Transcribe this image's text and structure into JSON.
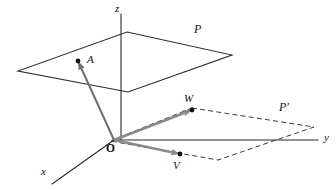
{
  "figure": {
    "background_color": "#ffffff",
    "line_color": "#2b2b2b",
    "vector_color": "#8a8a8a",
    "dot_color": "#111111"
  },
  "axes": [
    {
      "id": "z",
      "label": "z",
      "label_x": 115,
      "label_y": 3,
      "from": [
        121,
        140
      ],
      "to": [
        121,
        14
      ]
    },
    {
      "id": "y",
      "label": "y",
      "label_x": 324,
      "label_y": 132,
      "from": [
        114,
        140
      ],
      "to": [
        318,
        140
      ]
    },
    {
      "id": "x",
      "label": "x",
      "label_x": 41,
      "label_y": 166,
      "from": [
        114,
        140
      ],
      "to": [
        52,
        184
      ]
    }
  ],
  "origin": {
    "label": "O",
    "x": 114,
    "y": 140,
    "label_x": 106,
    "label_y": 143
  },
  "planes": [
    {
      "id": "P",
      "label": "P",
      "style": "solid",
      "label_x": 194,
      "label_y": 23,
      "corners": [
        [
          127,
          32
        ],
        [
          232,
          55
        ],
        [
          128,
          92
        ],
        [
          18,
          71
        ]
      ]
    },
    {
      "id": "P-prime",
      "label": "P'",
      "style": "dashed",
      "label_x": 279,
      "label_y": 101,
      "corners": [
        [
          192,
          108
        ],
        [
          314,
          127
        ],
        [
          218,
          160
        ],
        [
          110,
          141
        ]
      ]
    }
  ],
  "points": [
    {
      "id": "A",
      "label": "A",
      "x": 78,
      "y": 61,
      "label_x": 87,
      "label_y": 54,
      "dot_r": 2.4
    },
    {
      "id": "W",
      "label": "W",
      "x": 192,
      "y": 110,
      "label_x": 184,
      "label_y": 93,
      "dot_r": 2.4
    },
    {
      "id": "V",
      "label": "V",
      "x": 180,
      "y": 154,
      "label_x": 173,
      "label_y": 160,
      "dot_r": 2.4
    }
  ],
  "vectors": [
    {
      "id": "OA",
      "from": [
        114,
        140
      ],
      "to": [
        78,
        61
      ],
      "color": "#6f6f6f",
      "width": 2.0,
      "head": "arrow"
    },
    {
      "id": "OW",
      "from": [
        114,
        140
      ],
      "to": [
        192,
        110
      ],
      "color": "#8a8a8a",
      "width": 2.6,
      "head": "arrow"
    },
    {
      "id": "OV",
      "from": [
        114,
        140
      ],
      "to": [
        180,
        154
      ],
      "color": "#8a8a8a",
      "width": 2.6,
      "head": "arrow"
    }
  ],
  "caption": {
    "point_a_note": "A",
    "plane_p_note": "P",
    "plane_pprime_note": "P'"
  }
}
